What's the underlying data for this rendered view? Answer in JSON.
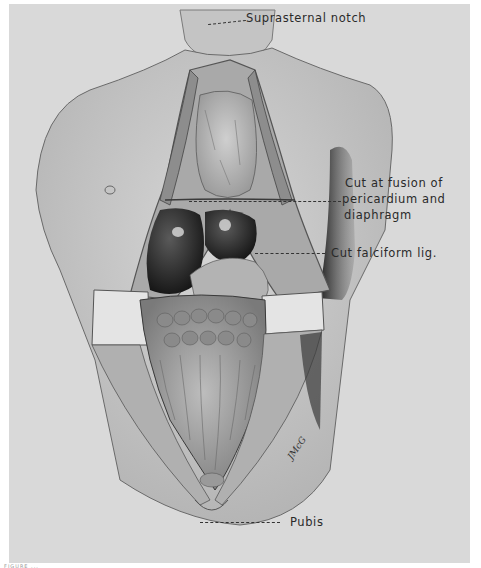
{
  "figure": {
    "background": "#d9d9d9",
    "labels": [
      {
        "id": "suprasternal-notch",
        "text": "Suprasternal notch"
      },
      {
        "id": "cut-fusion-line1",
        "text": "Cut at fusion of"
      },
      {
        "id": "cut-fusion-line2",
        "text": "pericardium and"
      },
      {
        "id": "cut-fusion-line3",
        "text": "diaphragm"
      },
      {
        "id": "cut-falciform",
        "text": "Cut falciform lig."
      },
      {
        "id": "pubis",
        "text": "Pubis"
      }
    ],
    "signature": "JMcG",
    "caption": "FIGURE ..."
  }
}
